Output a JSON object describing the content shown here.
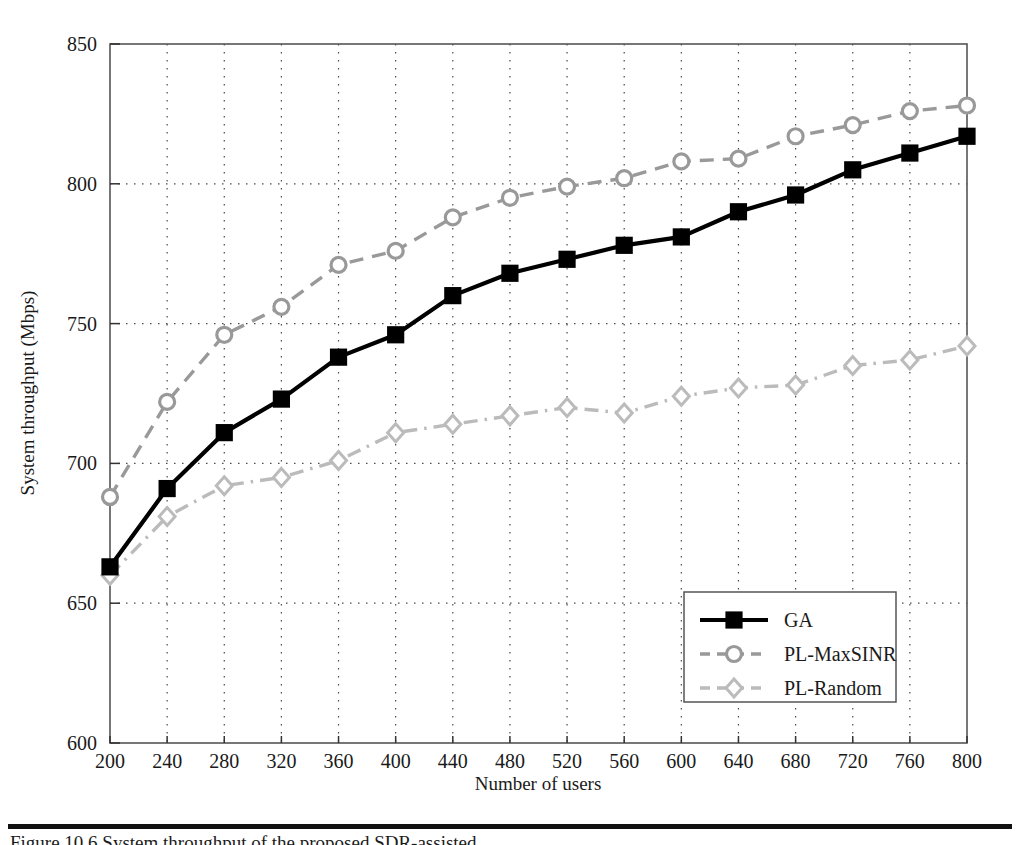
{
  "figure": {
    "caption": "Figure 10.6  System throughput of the proposed SDR-assisted ...",
    "rule_color": "#111111"
  },
  "chart_data": {
    "type": "line",
    "title": "",
    "xlabel": "Number of users",
    "ylabel": "System throughput (Mbps)",
    "x": [
      200,
      240,
      280,
      320,
      360,
      400,
      440,
      480,
      520,
      560,
      600,
      640,
      680,
      720,
      760,
      800
    ],
    "xlim": [
      200,
      800
    ],
    "ylim": [
      600,
      850
    ],
    "xticks": [
      200,
      240,
      280,
      320,
      360,
      400,
      440,
      480,
      520,
      560,
      600,
      640,
      680,
      720,
      760,
      800
    ],
    "yticks": [
      600,
      650,
      700,
      750,
      800,
      850
    ],
    "grid": "dotted-both",
    "legend_position": "lower-right",
    "series": [
      {
        "name": "GA",
        "color": "#000000",
        "linestyle": "solid",
        "marker": "square",
        "values": [
          663,
          691,
          711,
          723,
          738,
          746,
          760,
          768,
          773,
          778,
          781,
          790,
          796,
          805,
          811,
          817
        ]
      },
      {
        "name": "PL-MaxSINR",
        "color": "#999999",
        "linestyle": "dashed",
        "marker": "circle",
        "values": [
          688,
          722,
          746,
          756,
          771,
          776,
          788,
          795,
          799,
          802,
          808,
          809,
          817,
          821,
          826,
          828
        ]
      },
      {
        "name": "PL-Random",
        "color": "#bbbbbb",
        "linestyle": "dashdot",
        "marker": "diamond",
        "values": [
          660,
          681,
          692,
          695,
          701,
          711,
          714,
          717,
          720,
          718,
          724,
          727,
          728,
          735,
          737,
          742
        ]
      }
    ]
  }
}
